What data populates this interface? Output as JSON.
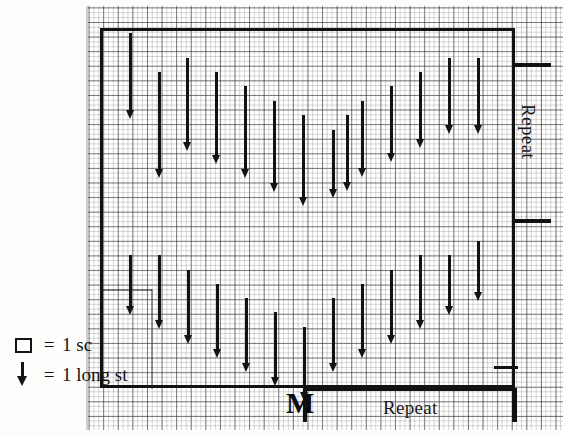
{
  "chart_data": {
    "type": "table",
    "grid": {
      "cell_px": 14.6,
      "subdivision_px": 4.87,
      "columns": 28,
      "rows": 25
    },
    "symbols": [
      {
        "key": "sc",
        "glyph": "open-square",
        "meaning": "1 sc"
      },
      {
        "key": "long_st",
        "glyph": "down-arrow",
        "meaning": "1 long st"
      }
    ],
    "pattern_outline": {
      "x": 100,
      "y": 28,
      "width": 415,
      "height": 360
    },
    "bands": [
      {
        "name": "upper-repeat",
        "top": 28,
        "bottom": 222
      },
      {
        "name": "lower-repeat",
        "top": 222,
        "bottom": 388
      }
    ],
    "arrows": [
      {
        "x": 131,
        "y": 33,
        "len": 78
      },
      {
        "x": 188,
        "y": 58,
        "len": 85
      },
      {
        "x": 217,
        "y": 72,
        "len": 84
      },
      {
        "x": 246,
        "y": 86,
        "len": 84
      },
      {
        "x": 275,
        "y": 101,
        "len": 83
      },
      {
        "x": 304,
        "y": 115,
        "len": 83
      },
      {
        "x": 348,
        "y": 115,
        "len": 68
      },
      {
        "x": 363,
        "y": 101,
        "len": 68
      },
      {
        "x": 392,
        "y": 86,
        "len": 68
      },
      {
        "x": 421,
        "y": 72,
        "len": 68
      },
      {
        "x": 450,
        "y": 58,
        "len": 68
      },
      {
        "x": 479,
        "y": 58,
        "len": 68
      },
      {
        "x": 160,
        "y": 72,
        "len": 98
      },
      {
        "x": 334,
        "y": 130,
        "len": 60
      },
      {
        "x": 131,
        "y": 255,
        "len": 52
      },
      {
        "x": 160,
        "y": 255,
        "len": 66
      },
      {
        "x": 189,
        "y": 270,
        "len": 66
      },
      {
        "x": 218,
        "y": 284,
        "len": 66
      },
      {
        "x": 247,
        "y": 298,
        "len": 66
      },
      {
        "x": 276,
        "y": 312,
        "len": 66
      },
      {
        "x": 305,
        "y": 327,
        "len": 66
      },
      {
        "x": 334,
        "y": 298,
        "len": 66
      },
      {
        "x": 363,
        "y": 284,
        "len": 66
      },
      {
        "x": 392,
        "y": 270,
        "len": 66
      },
      {
        "x": 421,
        "y": 255,
        "len": 66
      },
      {
        "x": 450,
        "y": 255,
        "len": 52
      },
      {
        "x": 479,
        "y": 241,
        "len": 52
      }
    ]
  },
  "legend": {
    "rows": [
      {
        "symbol": "sc-square-icon",
        "equals": "=",
        "text": "1 sc"
      },
      {
        "symbol": "long-stitch-arrow-icon",
        "equals": "=",
        "text": "1 long st"
      }
    ]
  },
  "labels": {
    "repeat_vertical": "Repeat",
    "repeat_bottom": "Repeat",
    "marker": "M"
  },
  "colors": {
    "ink": "#121212",
    "grid_major": "#282832",
    "grid_minor": "#464655",
    "paper": "#fffffd"
  }
}
